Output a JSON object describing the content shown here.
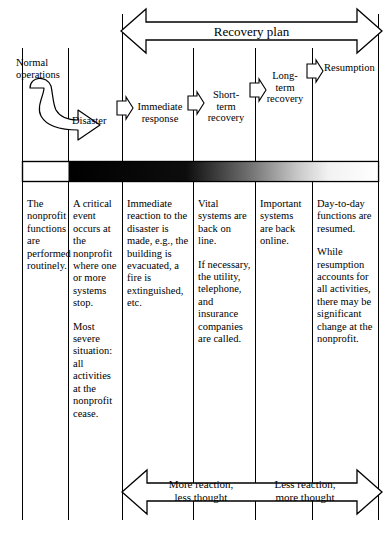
{
  "figure": {
    "top_arrow_label": "Recovery plan",
    "bottom_arrow_left_label": "More reaction,\nless thought",
    "bottom_arrow_right_label": "Less reaction,\nmore thought",
    "bottom_arrow_left_line1": "More reaction,",
    "bottom_arrow_left_line2": "less thought",
    "bottom_arrow_right_line1": "Less reaction,",
    "bottom_arrow_right_line2": "more thought",
    "normal_operations_label_line1": "Normal",
    "normal_operations_label_line2": "operations",
    "disaster_label": "Disaster",
    "stage_labels": [
      {
        "id": "immediate-response",
        "line1": "Immediate",
        "line2": "response",
        "line3": ""
      },
      {
        "id": "short-term-recovery",
        "line1": "Short-",
        "line2": "term",
        "line3": "recovery"
      },
      {
        "id": "long-term-recovery",
        "line1": "Long-",
        "line2": "term",
        "line3": "recovery"
      },
      {
        "id": "resumption",
        "line1": "Resumption",
        "line2": "",
        "line3": ""
      }
    ],
    "columns": [
      {
        "id": "normal-operations",
        "paragraphs": [
          "The nonprofit functions are performed routinely."
        ]
      },
      {
        "id": "disaster",
        "paragraphs": [
          "A critical event occurs at the nonprofit where one or more systems stop.",
          "Most severe situation: all activities at the nonprofit cease."
        ]
      },
      {
        "id": "immediate-response",
        "paragraphs": [
          "Immediate reaction to the disaster is made, e.g., the building is evacuated, a fire is extinguished, etc."
        ]
      },
      {
        "id": "short-term-recovery",
        "paragraphs": [
          "Vital systems are back on line.",
          "If necessary, the utility, telephone, and insurance companies are called."
        ]
      },
      {
        "id": "long-term-recovery",
        "paragraphs": [
          "Important systems are back online."
        ]
      },
      {
        "id": "resumption",
        "paragraphs": [
          "Day-to-day functions are resumed.",
          "While resumption accounts for all activities, there may be significant change at the nonprofit."
        ]
      }
    ],
    "colors": {
      "line": "#000000",
      "bar_start": "#000000",
      "bar_end": "#ffffff",
      "background": "#ffffff"
    }
  }
}
